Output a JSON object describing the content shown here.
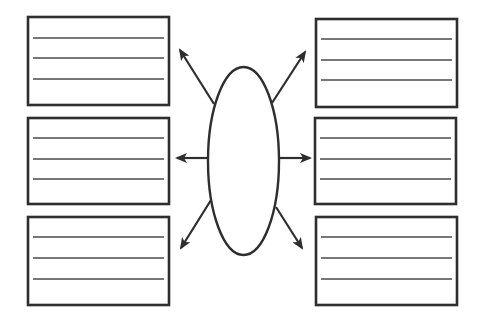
{
  "diagram": {
    "type": "graphic-organizer",
    "colors": {
      "stroke": "#2e2e2e",
      "rule": "#4a4a4a",
      "background": "#ffffff"
    },
    "center": {
      "shape": "ellipse",
      "cx": 243.5,
      "cy": 161,
      "rx": 35.5,
      "ry": 94,
      "text": ""
    },
    "boxes": [
      {
        "id": "top-left",
        "x": 28,
        "y": 17,
        "w": 141,
        "h": 88,
        "lines": [
          38,
          58,
          79
        ],
        "text": ""
      },
      {
        "id": "middle-left",
        "x": 28,
        "y": 118,
        "w": 141,
        "h": 86,
        "lines": [
          138,
          159,
          179
        ],
        "text": ""
      },
      {
        "id": "bottom-left",
        "x": 28,
        "y": 217,
        "w": 141,
        "h": 88,
        "lines": [
          237,
          258,
          279
        ],
        "text": ""
      },
      {
        "id": "top-right",
        "x": 316,
        "y": 19,
        "w": 141,
        "h": 88,
        "lines": [
          39,
          60,
          80
        ],
        "text": ""
      },
      {
        "id": "middle-right",
        "x": 315,
        "y": 118,
        "w": 141,
        "h": 86,
        "lines": [
          138,
          159,
          179
        ],
        "text": ""
      },
      {
        "id": "bottom-right",
        "x": 316,
        "y": 217,
        "w": 141,
        "h": 88,
        "lines": [
          237,
          258,
          279
        ],
        "text": ""
      }
    ],
    "arrows": [
      {
        "id": "arrow-top-left",
        "from": [
          214,
          104
        ],
        "to": [
          180,
          50
        ]
      },
      {
        "id": "arrow-middle-left",
        "from": [
          208,
          158
        ],
        "to": [
          177,
          158
        ]
      },
      {
        "id": "arrow-bottom-left",
        "from": [
          211,
          200
        ],
        "to": [
          181,
          248
        ]
      },
      {
        "id": "arrow-top-right",
        "from": [
          272,
          103
        ],
        "to": [
          305,
          52
        ]
      },
      {
        "id": "arrow-middle-right",
        "from": [
          279,
          158
        ],
        "to": [
          310,
          158
        ]
      },
      {
        "id": "arrow-bottom-right",
        "from": [
          276,
          207
        ],
        "to": [
          302,
          248
        ]
      }
    ]
  }
}
